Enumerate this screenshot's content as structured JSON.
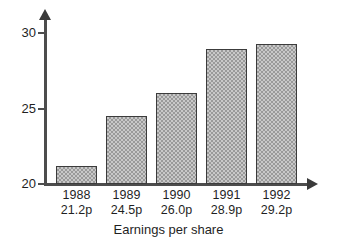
{
  "chart_data": {
    "type": "bar",
    "title": "",
    "subtitle": "",
    "xlabel": "Earnings per share",
    "ylabel": "",
    "categories": [
      "1988",
      "1989",
      "1990",
      "1991",
      "1992"
    ],
    "values": [
      21.2,
      24.5,
      26.0,
      28.9,
      29.2
    ],
    "value_labels": [
      "21.2p",
      "24.5p",
      "26.0p",
      "28.9p",
      "29.2p"
    ],
    "ylim": [
      20,
      30
    ],
    "yticks": [
      20,
      25,
      30
    ],
    "ytick_labels": [
      "20",
      "25",
      "30"
    ],
    "grid": false,
    "legend": null,
    "units": "p",
    "series": [
      {
        "name": "Earnings per share",
        "values": [
          21.2,
          24.5,
          26.0,
          28.9,
          29.2
        ]
      }
    ],
    "axis_style": {
      "y_axis_arrow": true,
      "x_axis_arrow": true,
      "bar_fill": "#c9c9c9",
      "bar_pattern": "checkerboard-dither",
      "bar_border": "#3c3c3c",
      "axis_color": "#4d4d4d"
    }
  },
  "axis": {
    "x_title": "Earnings per share"
  },
  "icons": {
    "y_arrow": "arrow-up-icon",
    "x_arrow": "arrow-right-icon"
  }
}
